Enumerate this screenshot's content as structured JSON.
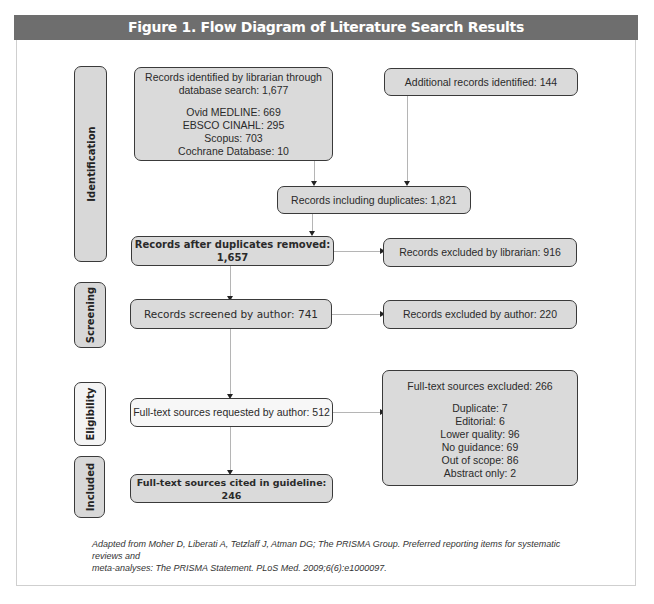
{
  "title": "Figure 1.  Flow Diagram of Literature Search Results",
  "stages": [
    {
      "label": "Identification"
    },
    {
      "label": "Screening"
    },
    {
      "label": "Eligibility"
    },
    {
      "label": "Included"
    }
  ],
  "boxes": {
    "db_search": {
      "line1": "Records identified by librarian through",
      "line2": "database search: 1,677",
      "sources": [
        "Ovid MEDLINE: 669",
        "EBSCO CINAHL: 295",
        "Scopus: 703",
        "Cochrane Database: 10"
      ]
    },
    "additional": "Additional records identified: 144",
    "including_duplicates": "Records including duplicates: 1,821",
    "after_duplicates": "Records after duplicates removed: 1,657",
    "excluded_librarian": "Records excluded by librarian: 916",
    "screened_author": "Records screened by author: 741",
    "excluded_author": "Records excluded by author: 220",
    "fulltext_requested": "Full-text sources requested by author: 512",
    "fulltext_excluded": {
      "title": "Full-text sources excluded: 266",
      "reasons": [
        "Duplicate: 7",
        "Editorial: 6",
        "Lower quality: 96",
        "No guidance: 69",
        "Out of scope: 86",
        "Abstract only: 2"
      ]
    },
    "cited": "Full-text sources cited in guideline: 246"
  },
  "caption": {
    "line1": "Adapted from Moher D, Liberati A, Tetzlaff J, Atman DG; The PRISMA Group. Preferred reporting items for systematic reviews and",
    "line2": "meta-analyses: The PRISMA Statement. PLoS Med. 2009;6(6):e1000097."
  },
  "colors": {
    "header_bg": "#6e6e6e",
    "box_fill": "#dadada",
    "box_border": "#3a3a3a",
    "connector": "#b5b5b5"
  }
}
